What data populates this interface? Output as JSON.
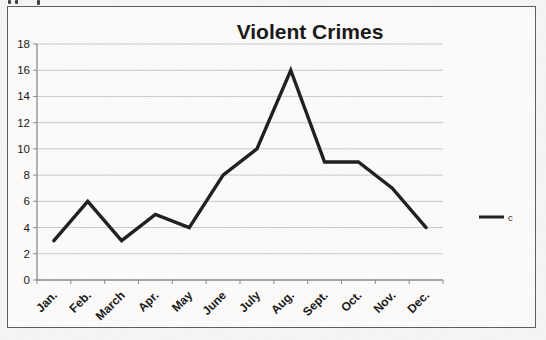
{
  "chart_data": {
    "type": "line",
    "title": "Violent Crimes",
    "categories": [
      "Jan.",
      "Feb.",
      "March",
      "Apr.",
      "May",
      "June",
      "July",
      "Aug.",
      "Sept.",
      "Oct.",
      "Nov.",
      "Dec."
    ],
    "series": [
      {
        "name": "c",
        "values": [
          3,
          6,
          3,
          5,
          4,
          8,
          10,
          16,
          9,
          9,
          7,
          4
        ]
      }
    ],
    "xlabel": "",
    "ylabel": "",
    "ylim": [
      0,
      18
    ],
    "yticks": [
      0,
      2,
      4,
      6,
      8,
      10,
      12,
      14,
      16,
      18
    ],
    "grid": true,
    "legend_position": "right",
    "colors": {
      "line": "#1c1c1c",
      "gridline": "#c9c9c9",
      "axis": "#8a8a8a",
      "text": "#161616"
    }
  }
}
